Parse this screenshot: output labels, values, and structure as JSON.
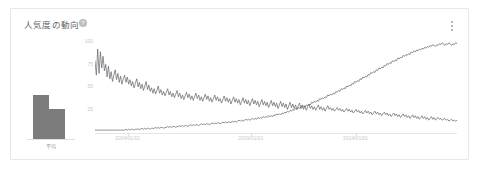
{
  "card": {
    "title": "人気度の動向",
    "help_icon": "help-circle-icon",
    "menu_icon": "more-vert-icon"
  },
  "average_widget": {
    "label": "平均",
    "bars": [
      100,
      68
    ]
  },
  "chart_data": {
    "type": "line",
    "title": "人気度の動向",
    "xlabel": "",
    "ylabel": "",
    "ylim": [
      0,
      100
    ],
    "yticks": [
      100,
      75,
      50,
      25
    ],
    "ytick_labels": [
      "100",
      "75",
      "50",
      "25"
    ],
    "xtick_labels": [
      "2004/01/01",
      "2009/01/01",
      "2014/01/01"
    ],
    "xtick_positions": [
      0.09,
      0.43,
      0.72
    ],
    "grid": false,
    "legend": "none",
    "series": [
      {
        "name": "series-1",
        "color": "#5f6368",
        "values": [
          78,
          62,
          91,
          64,
          88,
          70,
          83,
          67,
          74,
          60,
          72,
          58,
          66,
          55,
          62,
          68,
          57,
          64,
          54,
          61,
          52,
          58,
          62,
          54,
          60,
          52,
          57,
          50,
          55,
          48,
          53,
          58,
          49,
          54,
          47,
          52,
          45,
          50,
          55,
          46,
          51,
          44,
          48,
          42,
          47,
          41,
          45,
          50,
          42,
          46,
          40,
          44,
          39,
          43,
          47,
          40,
          44,
          38,
          42,
          37,
          41,
          45,
          38,
          42,
          36,
          40,
          35,
          39,
          43,
          37,
          41,
          35,
          39,
          34,
          38,
          42,
          36,
          40,
          34,
          38,
          33,
          37,
          41,
          35,
          39,
          33,
          37,
          32,
          36,
          40,
          34,
          38,
          33,
          36,
          31,
          35,
          39,
          33,
          37,
          32,
          36,
          30,
          34,
          38,
          32,
          36,
          31,
          35,
          29,
          33,
          37,
          31,
          35,
          30,
          34,
          28,
          32,
          36,
          30,
          34,
          29,
          33,
          27,
          31,
          35,
          29,
          33,
          28,
          32,
          26,
          30,
          34,
          28,
          32,
          27,
          31,
          25,
          29,
          33,
          27,
          31,
          26,
          30,
          24,
          28,
          32,
          26,
          30,
          25,
          29,
          24,
          28,
          31,
          25,
          29,
          24,
          28,
          23,
          27,
          30,
          25,
          28,
          24,
          27,
          23,
          26,
          29,
          24,
          27,
          23,
          26,
          22,
          25,
          28,
          24,
          26,
          23,
          25,
          22,
          24,
          26,
          23,
          25,
          22,
          24,
          21,
          23,
          25,
          22,
          24,
          21,
          23,
          20,
          22,
          24,
          21,
          23,
          20,
          22,
          19,
          21,
          23,
          20,
          22,
          19,
          21,
          18,
          20,
          22,
          19,
          21,
          18,
          20,
          17,
          19,
          21,
          18,
          20,
          17,
          19,
          16,
          18,
          20,
          17,
          19,
          16,
          18,
          15,
          17,
          19,
          16,
          18,
          15,
          17,
          14,
          16,
          18,
          15,
          17,
          14,
          16,
          13,
          15,
          17,
          14,
          16,
          13,
          15,
          12,
          14,
          16,
          13,
          15,
          12,
          14,
          15,
          13,
          14,
          12,
          13,
          14,
          12,
          13,
          11,
          12,
          13,
          11,
          12,
          11,
          12
        ]
      },
      {
        "name": "series-2",
        "color": "#5f6368",
        "values": [
          1,
          1,
          1,
          1,
          1,
          1,
          1,
          1,
          1,
          1,
          1,
          1,
          1,
          1,
          1,
          1,
          1,
          1,
          1,
          1,
          1,
          1,
          1,
          2,
          1,
          2,
          1,
          2,
          2,
          1,
          2,
          2,
          2,
          2,
          2,
          3,
          2,
          3,
          2,
          3,
          3,
          2,
          3,
          3,
          3,
          4,
          3,
          4,
          3,
          4,
          4,
          3,
          4,
          4,
          5,
          4,
          5,
          4,
          5,
          5,
          4,
          5,
          5,
          6,
          5,
          6,
          5,
          6,
          6,
          5,
          6,
          7,
          6,
          7,
          6,
          7,
          7,
          6,
          7,
          8,
          7,
          8,
          7,
          8,
          8,
          7,
          8,
          9,
          8,
          9,
          8,
          9,
          9,
          8,
          9,
          10,
          9,
          10,
          9,
          10,
          10,
          9,
          11,
          10,
          11,
          10,
          11,
          12,
          11,
          12,
          11,
          12,
          13,
          12,
          13,
          12,
          13,
          14,
          13,
          14,
          13,
          15,
          14,
          15,
          14,
          16,
          15,
          16,
          15,
          17,
          16,
          17,
          16,
          18,
          17,
          19,
          18,
          19,
          18,
          20,
          19,
          21,
          20,
          22,
          21,
          23,
          22,
          24,
          23,
          25,
          24,
          26,
          25,
          27,
          26,
          28,
          27,
          29,
          28,
          30,
          29,
          32,
          31,
          33,
          32,
          34,
          33,
          36,
          35,
          37,
          36,
          38,
          37,
          40,
          39,
          41,
          40,
          42,
          41,
          44,
          43,
          45,
          44,
          47,
          46,
          48,
          47,
          50,
          49,
          51,
          50,
          53,
          52,
          55,
          54,
          56,
          55,
          58,
          57,
          60,
          59,
          61,
          60,
          63,
          62,
          65,
          64,
          66,
          65,
          68,
          67,
          70,
          69,
          71,
          70,
          73,
          72,
          75,
          74,
          76,
          75,
          78,
          77,
          79,
          78,
          81,
          80,
          82,
          81,
          84,
          83,
          85,
          84,
          86,
          85,
          88,
          87,
          89,
          88,
          90,
          89,
          91,
          90,
          92,
          91,
          93,
          92,
          94,
          93,
          95,
          94,
          96,
          95,
          94,
          96,
          95,
          97,
          96,
          98,
          97,
          95,
          97,
          96,
          98,
          97,
          95,
          97,
          96,
          98,
          97
        ]
      }
    ]
  }
}
